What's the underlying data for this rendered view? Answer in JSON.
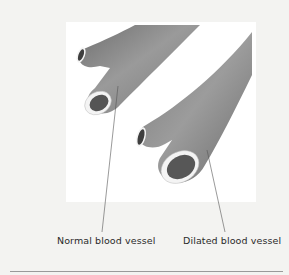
{
  "figure": {
    "labels": {
      "normal": "Normal blood vessel",
      "dilated": "Dilated blood vessel"
    },
    "colors": {
      "background": "#f3f3f1",
      "panel": "#ffffff",
      "vessel": "#8e8e8e",
      "vessel_dark": "#6e6e6e",
      "lumen": "#555555",
      "wall": "#f4f4f4",
      "leader_line": "#555555",
      "text": "#2a2a2a"
    }
  }
}
